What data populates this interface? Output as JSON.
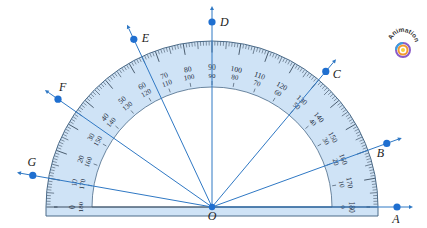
{
  "diagram": {
    "vertex": {
      "label": "O",
      "x": 212,
      "y": 207
    },
    "protractor": {
      "outer_radius": 166,
      "scale_inner_radius": 120,
      "base_bottom_y": 216,
      "fill_color": "#cfe3f6",
      "edge_color": "#4a6a88",
      "outer_scale": [
        "0",
        "10",
        "20",
        "30",
        "40",
        "50",
        "60",
        "70",
        "80",
        "90",
        "100",
        "110",
        "120",
        "130",
        "140",
        "150",
        "160",
        "170",
        "180"
      ],
      "inner_scale": [
        "180",
        "170",
        "160",
        "150",
        "140",
        "130",
        "120",
        "110",
        "100",
        "90",
        "80",
        "70",
        "60",
        "50",
        "40",
        "30",
        "20",
        "10",
        "0"
      ]
    },
    "rays": [
      {
        "label": "A",
        "angle_deg": 0,
        "point_dist": 185
      },
      {
        "label": "B",
        "angle_deg": 20,
        "point_dist": 186
      },
      {
        "label": "C",
        "angle_deg": 50,
        "point_dist": 177
      },
      {
        "label": "D",
        "angle_deg": 90,
        "point_dist": 185
      },
      {
        "label": "E",
        "angle_deg": 115,
        "point_dist": 185
      },
      {
        "label": "F",
        "angle_deg": 145,
        "point_dist": 188
      },
      {
        "label": "G",
        "angle_deg": 170,
        "point_dist": 182
      }
    ],
    "ray_color": "#2f78c4",
    "point_color": "#1f6fd0"
  },
  "badge": {
    "label": "Animation"
  }
}
